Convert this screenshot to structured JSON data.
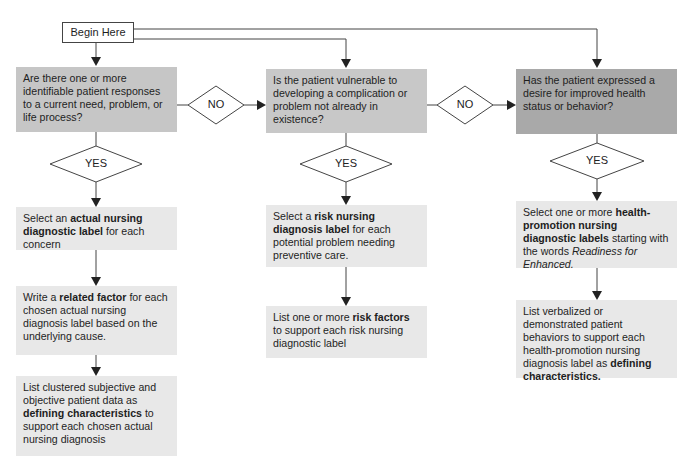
{
  "start": {
    "label": "Begin Here"
  },
  "columns": [
    {
      "question": "Are there one or more identifiable patient responses to a current need, problem, or life process?",
      "yes_label": "YES",
      "no_label": "NO",
      "steps": [
        {
          "pre": "Select an ",
          "bold": "actual nursing diagnostic label",
          "post": " for each concern"
        },
        {
          "pre": "Write a ",
          "bold": "related factor",
          "post": " for each chosen actual nursing diagnosis label based on the underlying cause."
        },
        {
          "pre": "List clustered subjective and objective patient data as ",
          "bold": "defining characteristics",
          "post": " to support each chosen actual nursing diagnosis"
        }
      ]
    },
    {
      "question": "Is the patient vulnerable to developing a complication or problem not already in existence?",
      "yes_label": "YES",
      "no_label": "NO",
      "steps": [
        {
          "pre": "Select a ",
          "bold": "risk nursing diagnosis label",
          "post": " for each potential problem needing preventive care."
        },
        {
          "pre": "List one or more ",
          "bold": "risk factors",
          "post": " to support each risk nursing diagnostic label"
        }
      ]
    },
    {
      "question": "Has the patient expressed a desire for improved health status or behavior?",
      "yes_label": "YES",
      "steps": [
        {
          "pre": "Select one or more ",
          "bold": "health-promotion nursing diagnostic labels",
          "post": " starting with the words ",
          "italic": "Readiness for Enhanced."
        },
        {
          "pre": "List verbalized or demonstrated patient behaviors to support each health-promotion nursing diagnosis label as ",
          "bold": "defining characteristics."
        }
      ]
    }
  ],
  "colors": {
    "question_box": "#c6c6c6",
    "question_box_dark": "#a9a9a9",
    "step_box": "#e8e8e8",
    "line": "#333333"
  }
}
